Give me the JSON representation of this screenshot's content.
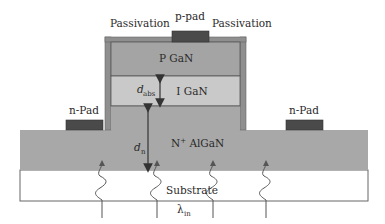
{
  "diagram": {
    "labels": {
      "p_pad": "p-pad",
      "passivation_left": "Passivation",
      "passivation_right": "Passivation",
      "p_gan": "P GaN",
      "i_gan": "I GaN",
      "n_pad_left": "n-Pad",
      "n_pad_right": "n-Pad",
      "n_algan_sup": "+",
      "n_algan_prefix": "N",
      "n_algan_suffix": " AlGaN",
      "substrate": "Substrate",
      "d_abs_main": "d",
      "d_abs_sub": "abs",
      "d_n_main": "d",
      "d_n_sub": "n",
      "lambda_main": "λ",
      "lambda_sub": "in"
    },
    "colors": {
      "n_algan": "#a8a8a8",
      "p_gan": "#a4a4a4",
      "i_gan": "#c9c9c9",
      "passivation": "#8f8f8f",
      "pad": "#4a4a4a",
      "substrate": "#ffffff",
      "outline": "#555555",
      "arrow": "#333333"
    }
  }
}
